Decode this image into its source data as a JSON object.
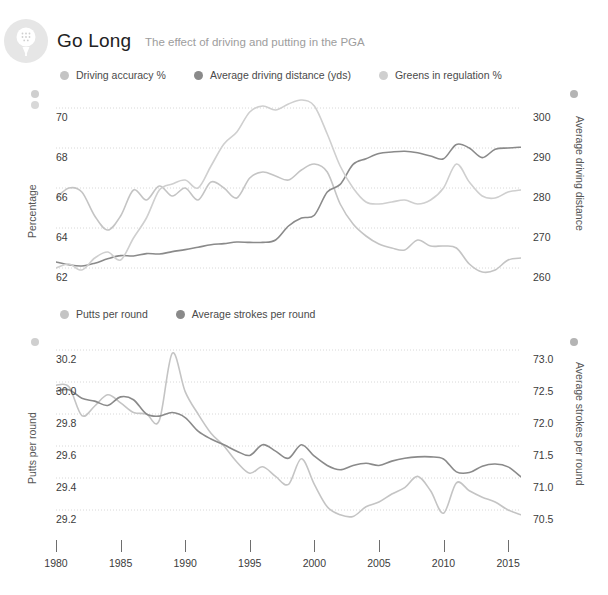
{
  "header": {
    "title": "Go Long",
    "subtitle": "The effect of driving and putting in the PGA",
    "logo_icon": "golf-ball-on-tee-icon"
  },
  "colors": {
    "light": "#c4c4c4",
    "mid": "#b0b0b0",
    "dark": "#8a8a8a",
    "gridline": "#d8d8d8",
    "axis_text": "#3b3b3b",
    "subtitle_text": "#9d9d9d",
    "logo_bg": "#e6e6e6"
  },
  "chart_top": {
    "legend": [
      {
        "label": "Driving accuracy %",
        "color": "#c4c4c4"
      },
      {
        "label": "Average driving distance (yds)",
        "color": "#8a8a8a"
      },
      {
        "label": "Greens in regulation %",
        "color": "#cfcfcf"
      }
    ],
    "left_axis_title": "Percentage",
    "right_axis_title": "Average driving distance",
    "left_ticks": [
      "70",
      "68",
      "66",
      "64",
      "62"
    ],
    "right_ticks": [
      "300",
      "290",
      "280",
      "270",
      "260"
    ]
  },
  "chart_bottom": {
    "legend": [
      {
        "label": "Putts per round",
        "color": "#c4c4c4"
      },
      {
        "label": "Average strokes per round",
        "color": "#8a8a8a"
      }
    ],
    "left_axis_title": "Putts per round",
    "right_axis_title": "Average strokes per round",
    "left_ticks": [
      "30.2",
      "30.0",
      "29.8",
      "29.6",
      "29.4",
      "29.2"
    ],
    "right_ticks": [
      "73.0",
      "72.5",
      "72.0",
      "71.5",
      "71.0",
      "70.5"
    ]
  },
  "x_axis": {
    "ticks": [
      "1980",
      "1985",
      "1990",
      "1995",
      "2000",
      "2005",
      "2010",
      "2015"
    ]
  },
  "chart_data": [
    {
      "type": "line",
      "title": "Go Long",
      "subtitle": "The effect of driving and putting in the PGA",
      "xlabel": "",
      "ylabel": "Percentage",
      "y2label": "Average driving distance",
      "xlim": [
        1980,
        2016
      ],
      "ylim": [
        61.0,
        71.0
      ],
      "y2lim": [
        255,
        305
      ],
      "yticks": [
        62,
        64,
        66,
        68,
        70
      ],
      "y2ticks": [
        260,
        270,
        280,
        290,
        300
      ],
      "xticks": [
        1980,
        1985,
        1990,
        1995,
        2000,
        2005,
        2010,
        2015
      ],
      "grid": true,
      "legend_position": "top",
      "x": [
        1980,
        1981,
        1982,
        1983,
        1984,
        1985,
        1986,
        1987,
        1988,
        1989,
        1990,
        1991,
        1992,
        1993,
        1994,
        1995,
        1996,
        1997,
        1998,
        1999,
        2000,
        2001,
        2002,
        2003,
        2004,
        2005,
        2006,
        2007,
        2008,
        2009,
        2010,
        2011,
        2012,
        2013,
        2014,
        2015,
        2016
      ],
      "series": [
        {
          "name": "Driving accuracy %",
          "axis": "left",
          "color": "#c4c4c4",
          "unit": "%",
          "values": [
            65.5,
            66.0,
            65.8,
            64.6,
            63.9,
            64.6,
            65.9,
            65.4,
            66.1,
            65.6,
            66.0,
            65.4,
            66.3,
            66.0,
            65.5,
            66.5,
            66.8,
            66.6,
            66.4,
            66.9,
            67.2,
            66.8,
            65.2,
            64.2,
            63.6,
            63.2,
            63.0,
            62.9,
            63.4,
            63.1,
            63.1,
            63.0,
            62.2,
            61.8,
            61.9,
            62.4,
            62.5
          ]
        },
        {
          "name": "Average driving distance (yds)",
          "axis": "right",
          "color": "#8a8a8a",
          "unit": "yds",
          "values": [
            261.5,
            260.8,
            260.5,
            261.2,
            262.3,
            263.1,
            263.0,
            263.6,
            263.5,
            264.1,
            264.6,
            265.2,
            265.8,
            266.1,
            266.5,
            266.4,
            266.4,
            267.0,
            270.5,
            272.5,
            273.2,
            279.0,
            280.9,
            285.9,
            287.3,
            288.6,
            289.0,
            289.2,
            288.8,
            288.0,
            287.3,
            290.9,
            290.0,
            287.6,
            289.7,
            290.0,
            290.2
          ]
        },
        {
          "name": "Greens in regulation %",
          "axis": "left",
          "color": "#cfcfcf",
          "unit": "%",
          "values": [
            62.0,
            62.2,
            61.9,
            62.5,
            62.8,
            62.4,
            63.5,
            64.5,
            65.9,
            66.2,
            66.4,
            66.0,
            67.1,
            68.2,
            68.8,
            69.8,
            70.1,
            69.9,
            70.2,
            70.4,
            70.1,
            68.7,
            67.1,
            66.0,
            65.3,
            65.2,
            65.3,
            65.4,
            65.2,
            65.4,
            66.0,
            67.2,
            66.3,
            65.6,
            65.5,
            65.8,
            65.9
          ]
        }
      ]
    },
    {
      "type": "line",
      "xlabel": "",
      "ylabel": "Putts per round",
      "y2label": "Average strokes per round",
      "xlim": [
        1980,
        2016
      ],
      "ylim": [
        29.05,
        30.3
      ],
      "y2lim": [
        70.3,
        73.1
      ],
      "yticks": [
        29.2,
        29.4,
        29.6,
        29.8,
        30.0,
        30.2
      ],
      "y2ticks": [
        70.5,
        71.0,
        71.5,
        72.0,
        72.5,
        73.0
      ],
      "xticks": [
        1980,
        1985,
        1990,
        1995,
        2000,
        2005,
        2010,
        2015
      ],
      "grid": true,
      "legend_position": "top",
      "x": [
        1980,
        1981,
        1982,
        1983,
        1984,
        1985,
        1986,
        1987,
        1988,
        1989,
        1990,
        1991,
        1992,
        1993,
        1994,
        1995,
        1996,
        1997,
        1998,
        1999,
        2000,
        2001,
        2002,
        2003,
        2004,
        2005,
        2006,
        2007,
        2008,
        2009,
        2010,
        2011,
        2012,
        2013,
        2014,
        2015,
        2016
      ],
      "series": [
        {
          "name": "Putts per round",
          "axis": "left",
          "color": "#c4c4c4",
          "values": [
            29.98,
            29.97,
            29.79,
            29.85,
            29.92,
            29.87,
            29.81,
            29.8,
            29.76,
            30.18,
            29.94,
            29.8,
            29.68,
            29.6,
            29.5,
            29.43,
            29.47,
            29.41,
            29.36,
            29.52,
            29.36,
            29.22,
            29.17,
            29.16,
            29.22,
            29.25,
            29.3,
            29.34,
            29.41,
            29.32,
            29.18,
            29.37,
            29.32,
            29.28,
            29.25,
            29.2,
            29.17
          ]
        },
        {
          "name": "Average strokes per round",
          "axis": "right",
          "color": "#8a8a8a",
          "values": [
            72.3,
            72.32,
            72.2,
            72.16,
            72.1,
            72.22,
            72.18,
            71.98,
            71.95,
            72.0,
            71.93,
            71.74,
            71.63,
            71.55,
            71.46,
            71.4,
            71.55,
            71.46,
            71.36,
            71.55,
            71.39,
            71.26,
            71.2,
            71.26,
            71.29,
            71.26,
            71.32,
            71.36,
            71.38,
            71.38,
            71.35,
            71.17,
            71.16,
            71.25,
            71.28,
            71.24,
            71.1
          ]
        }
      ]
    }
  ]
}
